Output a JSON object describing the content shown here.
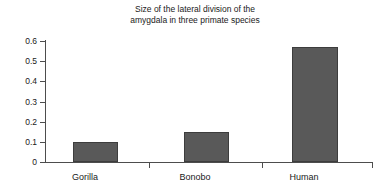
{
  "chart_data": {
    "type": "bar",
    "title": "Size of the lateral division of the\namygdala in three primate species",
    "categories": [
      "Gorilla",
      "Bonobo",
      "Human"
    ],
    "values": [
      0.1,
      0.15,
      0.57
    ],
    "xlabel": "",
    "ylabel": "",
    "ylim": [
      0,
      0.6
    ],
    "ytick_labels": [
      "0",
      "0.1",
      "0.2",
      "0.3",
      "0.4",
      "0.5",
      "0.6"
    ],
    "ytick_values": [
      0,
      0.1,
      0.2,
      0.3,
      0.4,
      0.5,
      0.6
    ],
    "grid": false,
    "legend": false,
    "bar_color": "#595959",
    "bar_border_color": "#3d3d3d",
    "axis_color": "#4d4d4d",
    "background": "#ffffff"
  }
}
